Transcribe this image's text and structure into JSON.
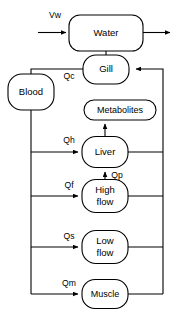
{
  "diagram": {
    "type": "flow-diagram",
    "background_color": "#ffffff",
    "line_color": "#000000",
    "nodes": [
      {
        "id": "water",
        "label": "Water",
        "shape": "rounded-rect",
        "x": 106,
        "y": 33,
        "w": 74,
        "h": 36
      },
      {
        "id": "gill",
        "label": "Gill",
        "shape": "rounded-rect",
        "x": 106,
        "y": 69,
        "w": 46,
        "h": 29
      },
      {
        "id": "blood",
        "label": "Blood",
        "shape": "rounded-rect",
        "x": 31,
        "y": 92,
        "w": 46,
        "h": 36
      },
      {
        "id": "metabolites",
        "label": "Metabolites",
        "shape": "rounded-rect",
        "x": 120,
        "y": 110,
        "w": 72,
        "h": 20
      },
      {
        "id": "liver",
        "label": "Liver",
        "shape": "rounded-rect",
        "x": 105,
        "y": 152,
        "w": 46,
        "h": 31
      },
      {
        "id": "highflow",
        "label": "High flow",
        "shape": "rounded-rect",
        "x": 105,
        "y": 196,
        "w": 46,
        "h": 33
      },
      {
        "id": "lowflow",
        "label": "Low flow",
        "shape": "rounded-rect",
        "x": 105,
        "y": 247,
        "w": 46,
        "h": 33
      },
      {
        "id": "muscle",
        "label": "Muscle",
        "shape": "rounded-rect",
        "x": 105,
        "y": 294,
        "w": 46,
        "h": 29
      }
    ],
    "flow_labels": [
      {
        "id": "vw",
        "label": "Vw",
        "x": 55,
        "y": 16,
        "desc": "water ventilation volume inflow"
      },
      {
        "id": "qc",
        "label": "Qc",
        "x": 69,
        "y": 76,
        "desc": "cardiac output from gill to blood"
      },
      {
        "id": "qh",
        "label": "Qh",
        "x": 69,
        "y": 141,
        "desc": "hepatic arterial blood flow to liver"
      },
      {
        "id": "qp",
        "label": "Qp",
        "x": 113,
        "y": 176,
        "desc": "portal blood flow from high flow to liver"
      },
      {
        "id": "qf",
        "label": "Qf",
        "x": 69,
        "y": 186,
        "desc": "blood flow to high flow tissue"
      },
      {
        "id": "qs",
        "label": "Qs",
        "x": 69,
        "y": 238,
        "desc": "blood flow to low flow tissue"
      },
      {
        "id": "qm",
        "label": "Qm",
        "x": 69,
        "y": 284,
        "desc": "blood flow to muscle"
      }
    ],
    "connections": [
      {
        "id": "vw-to-water",
        "from": "inflow",
        "to": "water",
        "arrow": true
      },
      {
        "id": "water-outflow",
        "from": "water",
        "to": "outflow",
        "arrow": true
      },
      {
        "id": "water-to-gill",
        "from": "water",
        "to": "gill",
        "arrow": false
      },
      {
        "id": "gill-to-blood",
        "from": "gill",
        "to": "blood",
        "arrow": false
      },
      {
        "id": "blood-to-liver",
        "from": "blood",
        "to": "liver",
        "arrow": true
      },
      {
        "id": "blood-to-highflow",
        "from": "blood",
        "to": "highflow",
        "arrow": true
      },
      {
        "id": "blood-to-lowflow",
        "from": "blood",
        "to": "lowflow",
        "arrow": true
      },
      {
        "id": "blood-to-muscle",
        "from": "blood",
        "to": "muscle",
        "arrow": true
      },
      {
        "id": "liver-to-metabolites",
        "from": "liver",
        "to": "metabolites",
        "arrow": true
      },
      {
        "id": "highflow-to-liver",
        "from": "highflow",
        "to": "liver",
        "arrow": true
      },
      {
        "id": "liver-to-return",
        "from": "liver",
        "to": "gill",
        "arrow": true
      },
      {
        "id": "highflow-to-return",
        "from": "highflow",
        "to": "gill",
        "arrow": true
      },
      {
        "id": "lowflow-to-return",
        "from": "lowflow",
        "to": "gill",
        "arrow": true
      },
      {
        "id": "muscle-to-return",
        "from": "muscle",
        "to": "gill",
        "arrow": true
      }
    ]
  }
}
